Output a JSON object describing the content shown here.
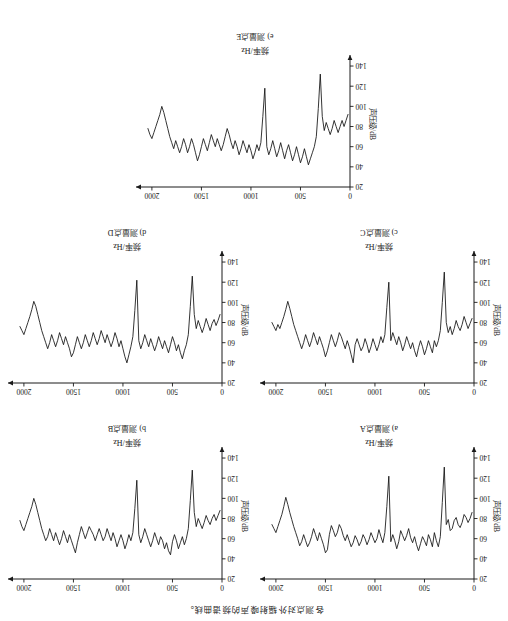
{
  "figure": {
    "caption": "各测点对外辐射噪声的频谱曲线。",
    "rotation_deg": 180
  },
  "axes": {
    "xlabel": "频率/Hz",
    "ylabel": "声压级/dB",
    "xticks": [
      "0",
      "500",
      "1000",
      "1500",
      "2000"
    ],
    "yticks": [
      "20",
      "40",
      "60",
      "80",
      "100",
      "120",
      "140"
    ],
    "xlim": [
      0,
      2100
    ],
    "ylim": [
      20,
      145
    ],
    "y_axis_inverted": true
  },
  "panels": [
    {
      "key": "a",
      "title": "a) 测量点A"
    },
    {
      "key": "b",
      "title": "b) 测量点B"
    },
    {
      "key": "c",
      "title": "c) 测量点C"
    },
    {
      "key": "d",
      "title": "d) 测量点D"
    },
    {
      "key": "e",
      "title": "e) 测量点E"
    }
  ],
  "chart_data": [
    {
      "type": "line",
      "id": "panel-a",
      "title": "a) 测量点A",
      "xlabel": "频率/Hz",
      "ylabel": "声压级/dB",
      "xlim": [
        0,
        2100
      ],
      "ylim": [
        20,
        145
      ],
      "grid": false,
      "legend": null,
      "x": [
        20,
        40,
        60,
        80,
        100,
        120,
        140,
        160,
        180,
        200,
        220,
        240,
        260,
        280,
        300,
        320,
        340,
        360,
        380,
        400,
        420,
        440,
        460,
        480,
        500,
        520,
        540,
        560,
        580,
        600,
        620,
        640,
        660,
        680,
        700,
        720,
        740,
        760,
        780,
        800,
        820,
        840,
        860,
        880,
        900,
        920,
        940,
        960,
        980,
        1000,
        1020,
        1040,
        1060,
        1080,
        1100,
        1120,
        1140,
        1160,
        1180,
        1200,
        1220,
        1240,
        1260,
        1280,
        1300,
        1320,
        1340,
        1360,
        1380,
        1400,
        1420,
        1440,
        1460,
        1480,
        1500,
        1520,
        1540,
        1560,
        1580,
        1600,
        1620,
        1640,
        1660,
        1680,
        1700,
        1720,
        1740,
        1760,
        1780,
        1800,
        1820,
        1840,
        1860,
        1880,
        1900,
        1920,
        1940,
        1960,
        1980,
        2000,
        2020,
        2040
      ],
      "values": [
        86,
        80,
        76,
        81,
        84,
        76,
        71,
        74,
        81,
        78,
        70,
        68,
        79,
        74,
        131,
        96,
        62,
        52,
        58,
        66,
        52,
        59,
        64,
        53,
        58,
        62,
        55,
        48,
        54,
        62,
        56,
        61,
        70,
        63,
        58,
        63,
        68,
        57,
        50,
        58,
        64,
        57,
        122,
        92,
        66,
        56,
        62,
        69,
        60,
        56,
        61,
        66,
        59,
        54,
        60,
        64,
        57,
        53,
        59,
        63,
        56,
        52,
        58,
        64,
        58,
        63,
        70,
        74,
        66,
        62,
        68,
        73,
        64,
        49,
        46,
        54,
        60,
        66,
        58,
        64,
        70,
        62,
        56,
        52,
        58,
        64,
        57,
        53,
        60,
        66,
        72,
        79,
        86,
        94,
        101,
        92,
        84,
        78,
        72,
        66,
        70,
        74
      ]
    },
    {
      "type": "line",
      "id": "panel-b",
      "title": "b) 测量点B",
      "xlabel": "频率/Hz",
      "ylabel": "声压级/dB",
      "xlim": [
        0,
        2100
      ],
      "ylim": [
        20,
        145
      ],
      "grid": false,
      "legend": null,
      "x": [
        20,
        40,
        60,
        80,
        100,
        120,
        140,
        160,
        180,
        200,
        220,
        240,
        260,
        280,
        300,
        320,
        340,
        360,
        380,
        400,
        420,
        440,
        460,
        480,
        500,
        520,
        540,
        560,
        580,
        600,
        620,
        640,
        660,
        680,
        700,
        720,
        740,
        760,
        780,
        800,
        820,
        840,
        860,
        880,
        900,
        920,
        940,
        960,
        980,
        1000,
        1020,
        1040,
        1060,
        1080,
        1100,
        1120,
        1140,
        1160,
        1180,
        1200,
        1220,
        1240,
        1260,
        1280,
        1300,
        1320,
        1340,
        1360,
        1380,
        1400,
        1420,
        1440,
        1460,
        1480,
        1500,
        1520,
        1540,
        1560,
        1580,
        1600,
        1620,
        1640,
        1660,
        1680,
        1700,
        1720,
        1740,
        1760,
        1780,
        1800,
        1820,
        1840,
        1860,
        1880,
        1900,
        1920,
        1940,
        1960,
        1980,
        2000,
        2020,
        2040
      ],
      "values": [
        88,
        83,
        78,
        84,
        80,
        74,
        78,
        83,
        76,
        70,
        75,
        80,
        72,
        86,
        128,
        98,
        70,
        60,
        54,
        62,
        56,
        50,
        58,
        64,
        57,
        44,
        48,
        56,
        50,
        58,
        62,
        54,
        60,
        66,
        58,
        52,
        58,
        64,
        70,
        62,
        56,
        64,
        118,
        90,
        66,
        58,
        64,
        56,
        50,
        58,
        64,
        58,
        52,
        60,
        66,
        58,
        64,
        70,
        62,
        58,
        64,
        70,
        64,
        58,
        64,
        68,
        72,
        66,
        60,
        66,
        72,
        64,
        56,
        46,
        52,
        58,
        64,
        56,
        62,
        68,
        60,
        54,
        60,
        66,
        58,
        64,
        70,
        62,
        58,
        64,
        70,
        78,
        86,
        94,
        100,
        92,
        86,
        80,
        74,
        68,
        72,
        78
      ]
    },
    {
      "type": "line",
      "id": "panel-c",
      "title": "c) 测量点C",
      "xlabel": "频率/Hz",
      "ylabel": "声压级/dB",
      "xlim": [
        0,
        2100
      ],
      "ylim": [
        20,
        145
      ],
      "grid": false,
      "legend": null,
      "x": [
        20,
        40,
        60,
        80,
        100,
        120,
        140,
        160,
        180,
        200,
        220,
        240,
        260,
        280,
        300,
        320,
        340,
        360,
        380,
        400,
        420,
        440,
        460,
        480,
        500,
        520,
        540,
        560,
        580,
        600,
        620,
        640,
        660,
        680,
        700,
        720,
        740,
        760,
        780,
        800,
        820,
        840,
        860,
        880,
        900,
        920,
        940,
        960,
        980,
        1000,
        1020,
        1040,
        1060,
        1080,
        1100,
        1120,
        1140,
        1160,
        1180,
        1200,
        1220,
        1240,
        1260,
        1280,
        1300,
        1320,
        1340,
        1360,
        1380,
        1400,
        1420,
        1440,
        1460,
        1480,
        1500,
        1520,
        1540,
        1560,
        1580,
        1600,
        1620,
        1640,
        1660,
        1680,
        1700,
        1720,
        1740,
        1760,
        1780,
        1800,
        1820,
        1840,
        1860,
        1880,
        1900,
        1920,
        1940,
        1960,
        1980,
        2000,
        2020,
        2040
      ],
      "values": [
        84,
        79,
        74,
        80,
        86,
        78,
        72,
        76,
        82,
        74,
        68,
        76,
        70,
        80,
        130,
        100,
        72,
        62,
        56,
        62,
        50,
        56,
        62,
        54,
        48,
        56,
        62,
        55,
        46,
        52,
        60,
        54,
        60,
        66,
        58,
        52,
        60,
        66,
        58,
        64,
        70,
        62,
        120,
        95,
        68,
        60,
        66,
        58,
        52,
        58,
        64,
        56,
        50,
        58,
        64,
        56,
        52,
        58,
        64,
        58,
        40,
        48,
        56,
        62,
        54,
        60,
        66,
        70,
        62,
        56,
        62,
        68,
        60,
        52,
        46,
        54,
        60,
        66,
        58,
        64,
        70,
        62,
        56,
        62,
        68,
        60,
        54,
        60,
        66,
        72,
        78,
        86,
        94,
        101,
        93,
        86,
        80,
        74,
        78,
        72,
        76,
        80
      ]
    },
    {
      "type": "line",
      "id": "panel-d",
      "title": "d) 测量点D",
      "xlabel": "频率/Hz",
      "ylabel": "声压级/dB",
      "xlim": [
        0,
        2100
      ],
      "ylim": [
        20,
        145
      ],
      "grid": false,
      "legend": null,
      "x": [
        20,
        40,
        60,
        80,
        100,
        120,
        140,
        160,
        180,
        200,
        220,
        240,
        260,
        280,
        300,
        320,
        340,
        360,
        380,
        400,
        420,
        440,
        460,
        480,
        500,
        520,
        540,
        560,
        580,
        600,
        620,
        640,
        660,
        680,
        700,
        720,
        740,
        760,
        780,
        800,
        820,
        840,
        860,
        880,
        900,
        920,
        940,
        960,
        980,
        1000,
        1020,
        1040,
        1060,
        1080,
        1100,
        1120,
        1140,
        1160,
        1180,
        1200,
        1220,
        1240,
        1260,
        1280,
        1300,
        1320,
        1340,
        1360,
        1380,
        1400,
        1420,
        1440,
        1460,
        1480,
        1500,
        1520,
        1540,
        1560,
        1580,
        1600,
        1620,
        1640,
        1660,
        1680,
        1700,
        1720,
        1740,
        1760,
        1780,
        1800,
        1820,
        1840,
        1860,
        1880,
        1900,
        1920,
        1940,
        1960,
        1980,
        2000,
        2020,
        2040
      ],
      "values": [
        88,
        82,
        77,
        83,
        79,
        72,
        78,
        84,
        76,
        70,
        76,
        82,
        74,
        88,
        126,
        96,
        68,
        58,
        52,
        44,
        50,
        58,
        52,
        60,
        66,
        58,
        50,
        56,
        62,
        54,
        60,
        66,
        58,
        52,
        58,
        64,
        56,
        62,
        68,
        60,
        54,
        62,
        122,
        92,
        66,
        56,
        48,
        40,
        46,
        54,
        62,
        56,
        64,
        70,
        62,
        56,
        62,
        68,
        60,
        66,
        72,
        64,
        58,
        64,
        70,
        62,
        56,
        62,
        68,
        60,
        54,
        60,
        66,
        58,
        50,
        46,
        54,
        60,
        66,
        58,
        64,
        70,
        62,
        56,
        62,
        68,
        60,
        54,
        60,
        66,
        72,
        80,
        88,
        96,
        101,
        93,
        86,
        80,
        74,
        68,
        72,
        76
      ]
    },
    {
      "type": "line",
      "id": "panel-e",
      "title": "e) 测量点E",
      "xlabel": "频率/Hz",
      "ylabel": "声压级/dB",
      "xlim": [
        0,
        2100
      ],
      "ylim": [
        20,
        145
      ],
      "grid": false,
      "legend": null,
      "x": [
        20,
        40,
        60,
        80,
        100,
        120,
        140,
        160,
        180,
        200,
        220,
        240,
        260,
        280,
        300,
        320,
        340,
        360,
        380,
        400,
        420,
        440,
        460,
        480,
        500,
        520,
        540,
        560,
        580,
        600,
        620,
        640,
        660,
        680,
        700,
        720,
        740,
        760,
        780,
        800,
        820,
        840,
        860,
        880,
        900,
        920,
        940,
        960,
        980,
        1000,
        1020,
        1040,
        1060,
        1080,
        1100,
        1120,
        1140,
        1160,
        1180,
        1200,
        1220,
        1240,
        1260,
        1280,
        1300,
        1320,
        1340,
        1360,
        1380,
        1400,
        1420,
        1440,
        1460,
        1480,
        1500,
        1520,
        1540,
        1560,
        1580,
        1600,
        1620,
        1640,
        1660,
        1680,
        1700,
        1720,
        1740,
        1760,
        1780,
        1800,
        1820,
        1840,
        1860,
        1880,
        1900,
        1920,
        1940,
        1960,
        1980,
        2000,
        2020,
        2040
      ],
      "values": [
        92,
        86,
        80,
        86,
        80,
        74,
        80,
        86,
        78,
        72,
        78,
        84,
        76,
        90,
        132,
        98,
        70,
        60,
        54,
        48,
        42,
        50,
        58,
        50,
        44,
        52,
        60,
        52,
        46,
        54,
        62,
        56,
        48,
        56,
        64,
        56,
        50,
        58,
        66,
        58,
        52,
        60,
        118,
        90,
        64,
        56,
        62,
        54,
        48,
        56,
        62,
        54,
        60,
        66,
        58,
        52,
        60,
        66,
        58,
        64,
        72,
        78,
        70,
        62,
        56,
        62,
        68,
        60,
        66,
        72,
        64,
        56,
        62,
        68,
        60,
        52,
        46,
        54,
        62,
        68,
        60,
        54,
        62,
        68,
        60,
        54,
        60,
        66,
        58,
        64,
        70,
        78,
        86,
        94,
        100,
        92,
        86,
        80,
        74,
        68,
        72,
        78
      ]
    }
  ]
}
